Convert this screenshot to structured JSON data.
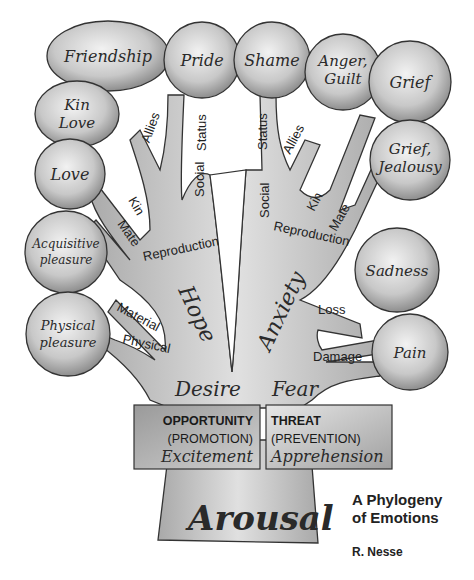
{
  "diagram": {
    "title_line1": "A Phylogeny",
    "title_line2": "of Emotions",
    "author": "R. Nesse",
    "trunk": {
      "base": "Arousal",
      "left": "Desire",
      "right": "Fear"
    },
    "boxes": {
      "left": {
        "line1": "OPPORTUNITY",
        "line2": "(PROMOTION)",
        "emotion": "Excitement"
      },
      "right": {
        "line1": "THREAT",
        "line2": "(PREVENTION)",
        "emotion": "Apprehension"
      }
    },
    "branch_moods": {
      "left": "Hope",
      "right": "Anxiety"
    },
    "left_branches": {
      "social": "Social",
      "allies": "Allies",
      "status": "Status",
      "reproduction": "Reproduction",
      "kin": "Kin",
      "mate": "Mate",
      "material": "Material",
      "physical": "Physical"
    },
    "right_branches": {
      "social": "Social",
      "status": "Status",
      "allies": "Allies",
      "reproduction": "Reproduction",
      "kin": "Kin",
      "mate": "Mate",
      "loss": "Loss",
      "damage": "Damage"
    },
    "emotions": {
      "friendship": "Friendship",
      "pride": "Pride",
      "shame": "Shame",
      "anger1": "Anger,",
      "anger2": "Guilt",
      "grief": "Grief",
      "kinlove1": "Kin",
      "kinlove2": "Love",
      "love": "Love",
      "griefj1": "Grief,",
      "griefj2": "Jealousy",
      "acq1": "Acquisitive",
      "acq2": "pleasure",
      "sadness": "Sadness",
      "phys1": "Physical",
      "phys2": "pleasure",
      "pain": "Pain"
    }
  }
}
